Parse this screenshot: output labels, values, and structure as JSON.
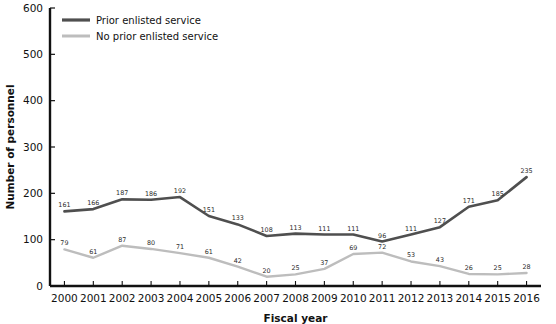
{
  "chart_data": {
    "type": "line",
    "title": "",
    "xlabel": "Fiscal year",
    "ylabel": "Number of personnel",
    "categories": [
      "2000",
      "2001",
      "2002",
      "2003",
      "2004",
      "2005",
      "2006",
      "2007",
      "2008",
      "2009",
      "2010",
      "2011",
      "2012",
      "2013",
      "2014",
      "2015",
      "2016"
    ],
    "ylim": [
      0,
      600
    ],
    "yticks": [
      0,
      100,
      200,
      300,
      400,
      500,
      600
    ],
    "grid": false,
    "legend_position": "top-left",
    "series": [
      {
        "name": "Prior enlisted service",
        "color": "#4f4f4f",
        "values": [
          161,
          166,
          187,
          186,
          192,
          151,
          133,
          108,
          113,
          111,
          111,
          96,
          111,
          127,
          171,
          185,
          235
        ]
      },
      {
        "name": "No prior enlisted service",
        "color": "#bdbdbd",
        "values": [
          79,
          61,
          87,
          80,
          71,
          61,
          42,
          20,
          25,
          37,
          69,
          72,
          53,
          43,
          26,
          25,
          28
        ]
      }
    ]
  },
  "axis": {
    "ylabel": "Number of personnel",
    "xlabel": "Fiscal year"
  },
  "legend": {
    "items": [
      {
        "label": "Prior enlisted service"
      },
      {
        "label": "No prior enlisted service"
      }
    ]
  }
}
